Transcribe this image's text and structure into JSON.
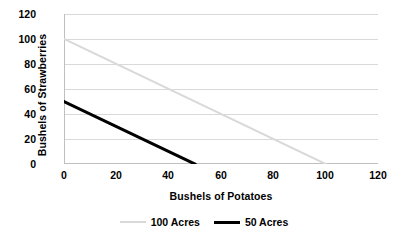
{
  "chart_data": {
    "type": "line",
    "title": "",
    "xlabel": "Bushels of Potatoes",
    "ylabel": "Bushels of Strawberries",
    "xlim": [
      0,
      120
    ],
    "ylim": [
      0,
      120
    ],
    "xticks": [
      0,
      20,
      40,
      60,
      80,
      100,
      120
    ],
    "yticks": [
      0,
      20,
      40,
      60,
      80,
      100,
      120
    ],
    "xtick_labels": [
      "0",
      "20",
      "40",
      "60",
      "80",
      "100",
      "120"
    ],
    "ytick_labels": [
      "0",
      "20",
      "40",
      "60",
      "80",
      "100",
      "120"
    ],
    "grid": "horizontal",
    "grid_color": "#D9D9D9",
    "legend_position": "bottom",
    "background": "#FFFFFF",
    "series": [
      {
        "name": "100 Acres",
        "color": "#D9D9D9",
        "width": 2,
        "x": [
          0,
          100
        ],
        "y": [
          100,
          0
        ]
      },
      {
        "name": "50 Acres",
        "color": "#000000",
        "width": 3,
        "x": [
          0,
          50
        ],
        "y": [
          50,
          0
        ]
      }
    ]
  },
  "axes": {
    "y_title": "Bushels of Strawberries",
    "x_title": "Bushels of Potatoes",
    "y_labels": [
      "120",
      "100",
      "80",
      "60",
      "40",
      "20",
      "0"
    ],
    "x_labels": [
      "0",
      "20",
      "40",
      "60",
      "80",
      "100",
      "120"
    ]
  },
  "legend": {
    "items": [
      {
        "label": "100 Acres",
        "style": "thin"
      },
      {
        "label": "50 Acres",
        "style": "thick"
      }
    ]
  }
}
